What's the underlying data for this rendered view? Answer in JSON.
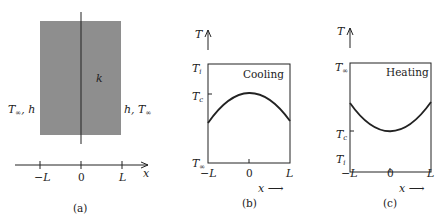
{
  "figure": {
    "panels": [
      {
        "id": "a",
        "caption": "(a)",
        "description": "Plane wall of thickness 2L with conductivity k, convection on both faces",
        "labels": {
          "conductivity": "k",
          "left_bc": "T∞, h",
          "right_bc": "h, T∞",
          "axis_var": "x"
        },
        "axis_ticks": [
          "−L",
          "0",
          "L"
        ],
        "colors": {
          "wall_fill": "#8c8c8c",
          "line": "#222222"
        }
      },
      {
        "id": "b",
        "caption": "(b)",
        "title": "Cooling",
        "y_axis_label": "T",
        "x_axis_label": "x",
        "y_levels": [
          "Ti",
          "Tc",
          "T∞"
        ],
        "x_ticks": [
          "−L",
          "0",
          "L"
        ],
        "curve": "concave-down parabola, max Tc at x=0"
      },
      {
        "id": "c",
        "caption": "(c)",
        "title": "Heating",
        "y_axis_label": "T",
        "x_axis_label": "x",
        "y_levels": [
          "T∞",
          "Tc",
          "Ti"
        ],
        "x_ticks": [
          "−L",
          "0",
          "L"
        ],
        "curve": "concave-up parabola, min Tc at x=0"
      }
    ]
  },
  "text": {
    "a_caption": "(a)",
    "b_caption": "(b)",
    "c_caption": "(c)",
    "k": "k",
    "left_bc": "T∞, h",
    "right_bc": "h, T∞",
    "neg_L": "−L",
    "zero": "0",
    "L": "L",
    "x": "x",
    "T": "T",
    "cooling": "Cooling",
    "heating": "Heating",
    "x_arrow": "x ⟶"
  }
}
